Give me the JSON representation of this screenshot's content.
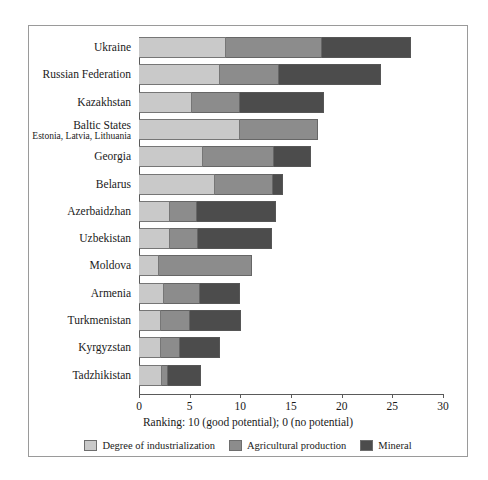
{
  "chart_data": {
    "type": "bar",
    "orientation": "horizontal",
    "stacked": true,
    "title": "",
    "subtitle": "",
    "xlabel": "Ranking: 10 (good potential); 0 (no potential)",
    "ylabel": "",
    "xlim": [
      0,
      30
    ],
    "xticks": [
      0,
      5,
      10,
      15,
      20,
      25,
      30
    ],
    "xtick_labels": [
      "0",
      "5",
      "10",
      "15",
      "20",
      "25",
      "30"
    ],
    "grid": false,
    "legend_position": "bottom",
    "categories": [
      "Ukraine",
      "Russian Federation",
      "Kazakhstan",
      "Baltic States",
      "Georgia",
      "Belarus",
      "Azerbaidzhan",
      "Uzbekistan",
      "Moldova",
      "Armenia",
      "Turkmenistan",
      "Kyrgyzstan",
      "Tadzhikistan"
    ],
    "category_sublabels": {
      "Baltic States": "Estonia, Latvia, Lithuania"
    },
    "series": [
      {
        "name": "Degree of industrialization",
        "color": "#c9c9c9",
        "values": [
          8.6,
          8.0,
          5.2,
          10.0,
          6.3,
          7.5,
          3.1,
          3.1,
          2.0,
          2.5,
          2.2,
          2.2,
          2.3
        ]
      },
      {
        "name": "Agricultural production",
        "color": "#8c8c8c",
        "values": [
          9.5,
          5.8,
          4.8,
          7.7,
          7.0,
          5.7,
          2.6,
          2.7,
          9.2,
          3.5,
          2.8,
          1.8,
          0.6
        ]
      },
      {
        "name": "Mineral",
        "color": "#4c4c4c",
        "values": [
          8.7,
          10.1,
          8.3,
          0.0,
          3.7,
          1.0,
          7.8,
          7.3,
          0.0,
          4.0,
          5.1,
          4.0,
          3.2
        ]
      }
    ],
    "totals": [
      26.8,
      23.9,
      18.3,
      17.7,
      17.0,
      14.2,
      13.5,
      13.1,
      11.2,
      10.0,
      10.1,
      8.0,
      6.1
    ]
  },
  "legend": {
    "items": [
      {
        "label": "Degree of industrialization",
        "color": "#c9c9c9"
      },
      {
        "label": "Agricultural production",
        "color": "#8c8c8c"
      },
      {
        "label": "Mineral",
        "color": "#4c4c4c"
      }
    ]
  }
}
